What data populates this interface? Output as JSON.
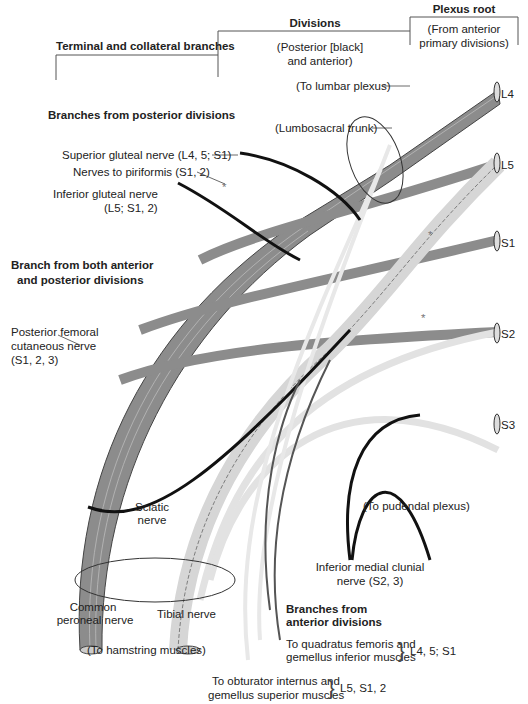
{
  "header": {
    "plexus_root": "Plexus root",
    "plexus_root_sub": [
      "(From anterior",
      "primary divisions)"
    ],
    "divisions": "Divisions",
    "divisions_sub": [
      "(Posterior [black]",
      "and anterior)"
    ],
    "terminal": "Terminal and collateral branches"
  },
  "roots": [
    "L4",
    "L5",
    "S1",
    "S2",
    "S3"
  ],
  "labels": {
    "to_lumbar_plexus": "(To lumbar plexus)",
    "lumbosacral_trunk": "(Lumbosacral trunk)",
    "posterior_heading": "Branches from posterior divisions",
    "superior_gluteal": "Superior gluteal nerve (L4, 5; S1)",
    "nerves_piriformis": "Nerves to piriformis (S1, 2)",
    "inferior_gluteal": [
      "Inferior gluteal nerve",
      "(L5; S1, 2)"
    ],
    "both_heading": [
      "Branch from both anterior",
      "and posterior divisions"
    ],
    "posterior_femoral": [
      "Posterior femoral",
      "cutaneous nerve",
      "(S1, 2, 3)"
    ],
    "to_pudendal": "(To pudendal plexus)",
    "sciatic": [
      "Sciatic",
      "nerve"
    ],
    "inferior_medial_clunial": [
      "Inferior medial clunial",
      "nerve (S2, 3)"
    ],
    "common_peroneal": [
      "Common",
      "peroneal nerve"
    ],
    "tibial": "Tibial nerve",
    "hamstring": "(To hamstring muscles)",
    "anterior_heading": [
      "Branches from",
      "anterior divisions"
    ],
    "quadratus": [
      "To quadratus femoris and",
      "gemellus inferior muscles"
    ],
    "quadratus_roots": "L4, 5; S1",
    "obturator": [
      "To obturator internus and",
      "gemellus superior muscles"
    ],
    "obturator_roots": "L5, S1, 2",
    "asterisk": "*"
  },
  "colors": {
    "anterior_fill": "#e2e2e2",
    "posterior_fill": "#8c8c8c",
    "black_branch": "#111111",
    "line": "#333333"
  }
}
